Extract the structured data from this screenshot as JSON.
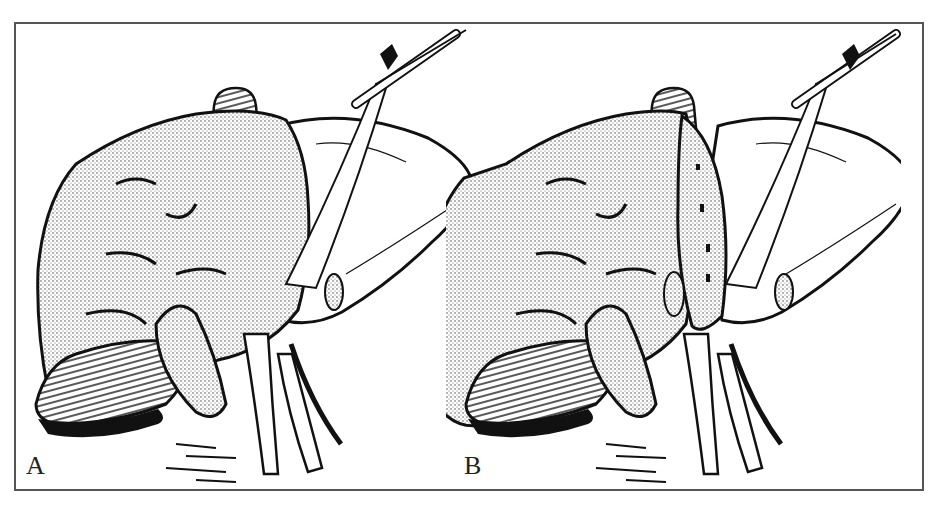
{
  "figure": {
    "type": "medical-illustration",
    "colors": {
      "ink": "#111111",
      "stipple": "#9a9a9a",
      "paper": "#ffffff",
      "border": "#555555"
    },
    "panels": [
      {
        "id": "A",
        "label": "A",
        "description": "Liver before parenchymal transection"
      },
      {
        "id": "B",
        "label": "B",
        "description": "Liver with exposed transection plane along the resection line"
      }
    ]
  }
}
